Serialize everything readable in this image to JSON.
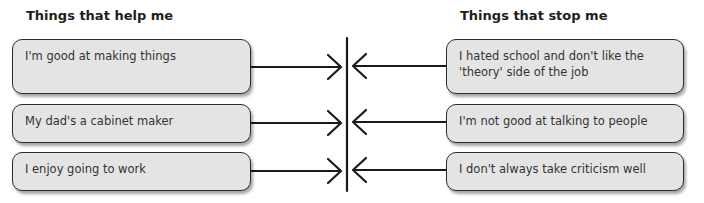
{
  "headings": {
    "help": "Things that help me",
    "stop": "Things that stop me"
  },
  "help_items": [
    "I'm good at making things",
    "My dad's a cabinet maker",
    "I enjoy going to work"
  ],
  "stop_items": [
    "I hated school and don't like the 'theory' side of the job",
    "I'm not good at talking to people",
    "I don't always take criticism well"
  ],
  "colors": {
    "box_fill": "#e4e4e4",
    "box_border": "#2b2b2b",
    "line": "#1a1a1a"
  }
}
